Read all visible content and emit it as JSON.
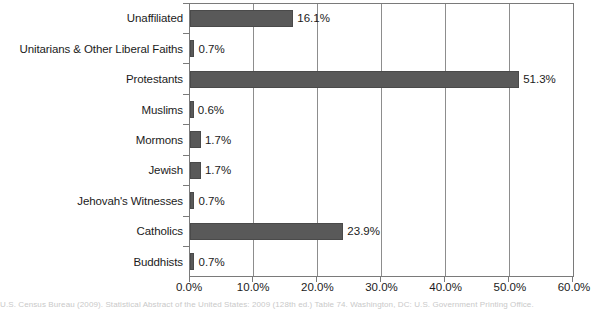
{
  "chart_data": {
    "type": "bar",
    "orientation": "horizontal",
    "title": "",
    "xlabel": "",
    "ylabel": "",
    "categories": [
      "Unaffiliated",
      "Unitarians & Other Liberal Faiths",
      "Protestants",
      "Muslims",
      "Mormons",
      "Jewish",
      "Jehovah's Witnesses",
      "Catholics",
      "Buddhists"
    ],
    "values": [
      16.1,
      0.7,
      51.3,
      0.6,
      1.7,
      1.7,
      0.7,
      23.9,
      0.7
    ],
    "value_labels": [
      "16.1%",
      "0.7%",
      "51.3%",
      "0.6%",
      "1.7%",
      "1.7%",
      "0.7%",
      "23.9%",
      "0.7%"
    ],
    "xlim": [
      0,
      60
    ],
    "xticks": [
      0,
      10,
      20,
      30,
      40,
      50,
      60
    ],
    "xtick_labels": [
      "0.0%",
      "10.0%",
      "20.0%",
      "30.0%",
      "40.0%",
      "50.0%",
      "60.0%"
    ],
    "grid": true,
    "grid_axis": "x",
    "legend": false,
    "bar_color": "#595959",
    "bar_edge_color": "#4a4a4a",
    "axis_color": "#7a7a7a",
    "background_color": "#ffffff"
  },
  "footer": {
    "citation": "U.S. Census Bureau (2009). Statistical Abstract of the United States: 2009 (128th ed.) Table 74. Washington, DC: U.S. Government Printing Office."
  }
}
